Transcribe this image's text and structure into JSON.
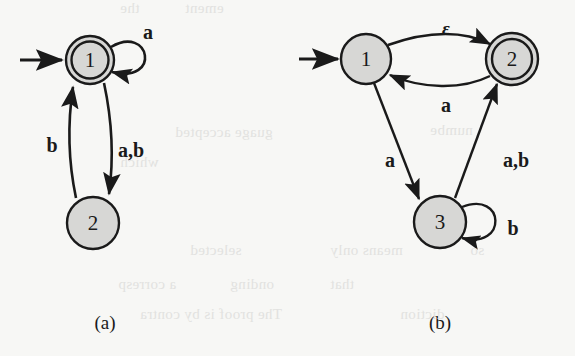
{
  "figure": {
    "background_color": "#f7f7f5",
    "ink_color": "#1a1a1a",
    "state_fill_color": "#d7d7d5",
    "captions": [
      {
        "id": "caption-a",
        "text": "(a)",
        "x": 105,
        "y": 322
      },
      {
        "id": "caption-b",
        "text": "(b)",
        "x": 440,
        "y": 322
      }
    ],
    "automaton_a": {
      "caption": "(a)",
      "states": [
        {
          "label": "1",
          "accepting": true,
          "start": true,
          "cx": 90,
          "cy": 60,
          "r": 24
        },
        {
          "label": "2",
          "accepting": false,
          "start": false,
          "cx": 93,
          "cy": 223,
          "r": 26
        }
      ],
      "transitions": [
        {
          "from": "1",
          "to": "1",
          "label": "a",
          "label_x": 148,
          "label_y": 32,
          "kind": "self-loop"
        },
        {
          "from": "2",
          "to": "1",
          "label": "b",
          "label_x": 52,
          "label_y": 145,
          "kind": "curve-up"
        },
        {
          "from": "1",
          "to": "2",
          "label": "a,b",
          "label_x": 117,
          "label_y": 150,
          "kind": "curve-down"
        }
      ]
    },
    "automaton_b": {
      "caption": "(b)",
      "states": [
        {
          "label": "1",
          "accepting": false,
          "start": true,
          "cx": 366,
          "cy": 59,
          "r": 25
        },
        {
          "label": "2",
          "accepting": true,
          "start": false,
          "cx": 512,
          "cy": 59,
          "r": 26
        },
        {
          "label": "3",
          "accepting": false,
          "start": false,
          "cx": 440,
          "cy": 222,
          "r": 26
        }
      ],
      "transitions": [
        {
          "from": "1",
          "to": "2",
          "label": "ε",
          "label_x": 446,
          "label_y": 31,
          "kind": "arc-top"
        },
        {
          "from": "2",
          "to": "1",
          "label": "a",
          "label_x": 446,
          "label_y": 103,
          "kind": "arc-bottom"
        },
        {
          "from": "1",
          "to": "3",
          "label": "a",
          "label_x": 390,
          "label_y": 160,
          "kind": "line"
        },
        {
          "from": "3",
          "to": "2",
          "label": "a,b",
          "label_x": 512,
          "label_y": 160,
          "kind": "line"
        },
        {
          "from": "3",
          "to": "3",
          "label": "b",
          "label_x": 512,
          "label_y": 228,
          "kind": "self-loop"
        }
      ]
    },
    "ghost_text": [
      {
        "text": "the",
        "x": 120,
        "y": 6,
        "size": 14
      },
      {
        "text": "ement",
        "x": 185,
        "y": 4,
        "size": 14
      },
      {
        "text": "guage accepted",
        "x": 175,
        "y": 130,
        "size": 15
      },
      {
        "text": "numbe",
        "x": 430,
        "y": 128,
        "size": 15
      },
      {
        "text": "which",
        "x": 120,
        "y": 160,
        "size": 15
      },
      {
        "text": "selected",
        "x": 190,
        "y": 248,
        "size": 15
      },
      {
        "text": "means  only",
        "x": 330,
        "y": 248,
        "size": 15
      },
      {
        "text": "so",
        "x": 470,
        "y": 248,
        "size": 15
      },
      {
        "text": "a corresp",
        "x": 118,
        "y": 282,
        "size": 15
      },
      {
        "text": "onding",
        "x": 230,
        "y": 282,
        "size": 15
      },
      {
        "text": "that",
        "x": 330,
        "y": 282,
        "size": 15
      },
      {
        "text": "The proof is by contra",
        "x": 140,
        "y": 312,
        "size": 15
      },
      {
        "text": "diction",
        "x": 400,
        "y": 312,
        "size": 15
      }
    ]
  }
}
